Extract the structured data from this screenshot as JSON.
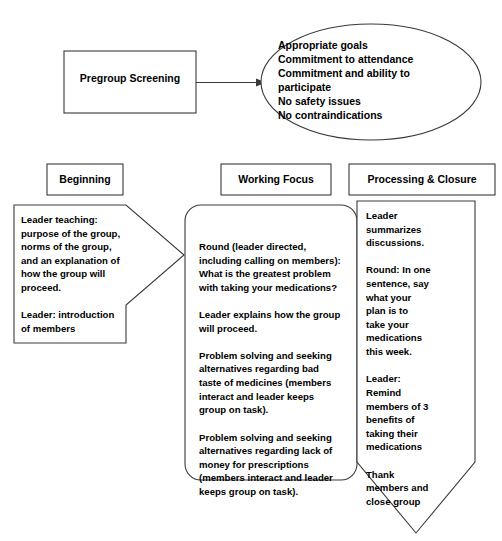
{
  "diagram": {
    "stroke_color": "#3a3a3a",
    "text_color": "#000000",
    "background_color": "#ffffff"
  },
  "intake": {
    "screening_box_label": "Pregroup Screening",
    "arrow_icon": "arrow-right-icon",
    "criteria_ellipse_text": "Appropriate goals\nCommitment to attendance\nCommitment and ability to\n    participate\nNo safety issues\nNo contraindications",
    "criteria_items": [
      "Appropriate goals",
      "Commitment to attendance",
      "Commitment and ability to participate",
      "No safety issues",
      "No contraindications"
    ]
  },
  "columns": [
    {
      "key": "beginning",
      "header": "Beginning",
      "shape": "right-arrow-pentagon",
      "body": "Leader teaching:\npurpose of the group,\nnorms of the group,\nand an explanation of\nhow the group will\nproceed.\n\nLeader: introduction\nof members",
      "body_paragraphs": [
        "Leader teaching: purpose of the group, norms of the group, and an explanation of how the group will proceed.",
        "Leader: introduction of members"
      ]
    },
    {
      "key": "working_focus",
      "header": "Working Focus",
      "shape": "rounded-rectangle",
      "body": "Round (leader directed,\nincluding calling on members):\nWhat is the greatest problem\nwith taking your medications?\n\nLeader explains how the group\nwill proceed.\n\nProblem solving and seeking\nalternatives regarding bad\ntaste of medicines (members\ninteract and leader keeps\ngroup on task).\n\nProblem solving and seeking\nalternatives regarding lack of\nmoney for prescriptions\n(members interact and leader\nkeeps group on task).",
      "body_paragraphs": [
        "Round (leader directed, including calling on members): What is the greatest problem with taking your medications?",
        "Leader explains how the group will proceed.",
        "Problem solving and seeking alternatives regarding bad taste of medicines (members interact and leader keeps group on task).",
        "Problem solving and seeking alternatives regarding lack of money for prescriptions (members interact and leader keeps group on task)."
      ]
    },
    {
      "key": "processing_closure",
      "header": "Processing & Closure",
      "shape": "down-arrow-banner",
      "body": "Leader\nsummarizes\ndiscussions.\n\nRound: In one\nsentence, say\nwhat your\nplan is to\ntake your\nmedications\nthis week.\n\nLeader:\nRemind\nmembers of 3\nbenefits of\ntaking their\nmedications\n\nThank\nmembers and\nclose group",
      "body_paragraphs": [
        "Leader summarizes discussions.",
        "Round: In one sentence, say what your plan is to take your medications this week.",
        "Leader: Remind members of 3 benefits of taking their medications",
        "Thank members and close group"
      ]
    }
  ]
}
